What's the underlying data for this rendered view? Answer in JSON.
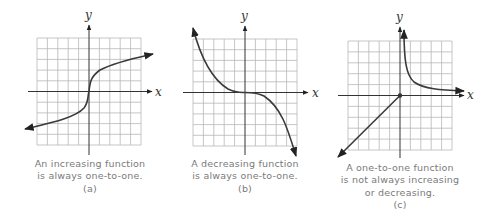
{
  "figure": {
    "panels": [
      {
        "id": "a",
        "x_label": "x",
        "y_label": "y",
        "caption_lines": [
          "An increasing function",
          "is always one-to-one."
        ],
        "tag": "(a)",
        "curve": "increasing S-shaped curve (cube-root-like) through origin"
      },
      {
        "id": "b",
        "x_label": "x",
        "y_label": "y",
        "caption_lines": [
          "A decreasing function",
          "is always one-to-one."
        ],
        "tag": "(b)",
        "curve": "decreasing cubic-like curve flattening at origin"
      },
      {
        "id": "c",
        "x_label": "x",
        "y_label": "y",
        "caption_lines": [
          "A one-to-one function",
          "is not always increasing",
          "or decreasing."
        ],
        "tag": "(c)",
        "curve": "line y=x for x<=0 plus hyperbola branch for x>0"
      }
    ]
  }
}
